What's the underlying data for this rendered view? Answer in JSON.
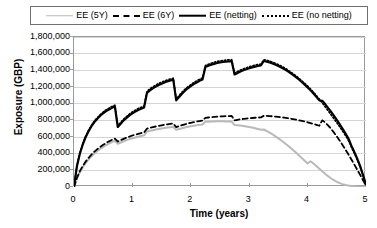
{
  "legend": {
    "items": [
      {
        "label": "EE (5Y)",
        "style": "solid-gray",
        "color": "#b9b9b9"
      },
      {
        "label": "EE (6Y)",
        "style": "dashed",
        "color": "#000000"
      },
      {
        "label": "EE (netting)",
        "style": "solid-black",
        "color": "#000000"
      },
      {
        "label": "EE (no netting)",
        "style": "dotted",
        "color": "#000000"
      }
    ]
  },
  "chart_data": {
    "type": "line",
    "title": "",
    "xlabel": "Time (years)",
    "ylabel": "Exposure (GBP)",
    "xlim": [
      0,
      5
    ],
    "ylim": [
      0,
      1800000
    ],
    "grid": true,
    "legend_position": "top",
    "xticks": [
      0,
      1,
      2,
      3,
      4,
      5
    ],
    "xtick_labels": [
      "0",
      "1",
      "2",
      "3",
      "4",
      "5"
    ],
    "yticks": [
      0,
      200000,
      400000,
      600000,
      800000,
      1000000,
      1200000,
      1400000,
      1600000,
      1800000
    ],
    "ytick_labels": [
      "0",
      "200,000",
      "400,000",
      "600,000",
      "800,000",
      "1,000,000",
      "1,200,000",
      "1,400,000",
      "1,600,000",
      "1,800,000"
    ],
    "x": [
      0,
      0.05,
      0.1,
      0.15,
      0.2,
      0.25,
      0.3,
      0.35,
      0.4,
      0.45,
      0.5,
      0.55,
      0.6,
      0.65,
      0.7,
      0.75,
      0.8,
      0.85,
      0.9,
      0.95,
      1.0,
      1.05,
      1.1,
      1.15,
      1.2,
      1.25,
      1.3,
      1.35,
      1.4,
      1.45,
      1.5,
      1.55,
      1.6,
      1.65,
      1.7,
      1.75,
      1.8,
      1.85,
      1.9,
      1.95,
      2.0,
      2.05,
      2.1,
      2.15,
      2.2,
      2.25,
      2.3,
      2.35,
      2.4,
      2.45,
      2.5,
      2.55,
      2.6,
      2.65,
      2.7,
      2.75,
      2.8,
      2.85,
      2.9,
      2.95,
      3.0,
      3.05,
      3.1,
      3.15,
      3.2,
      3.25,
      3.3,
      3.35,
      3.4,
      3.45,
      3.5,
      3.55,
      3.6,
      3.65,
      3.7,
      3.75,
      3.8,
      3.85,
      3.9,
      3.95,
      4.0,
      4.05,
      4.1,
      4.15,
      4.2,
      4.25,
      4.3,
      4.35,
      4.4,
      4.45,
      4.5,
      4.55,
      4.6,
      4.65,
      4.7,
      4.75,
      4.8,
      4.85,
      4.9,
      4.95,
      5.0
    ],
    "series": [
      {
        "name": "EE (netting)",
        "style": "solid",
        "color": "#000000",
        "width": 2.2,
        "values": [
          0,
          250000,
          400000,
          510000,
          600000,
          670000,
          730000,
          780000,
          820000,
          855000,
          885000,
          910000,
          930000,
          950000,
          965000,
          720000,
          760000,
          800000,
          830000,
          860000,
          885000,
          905000,
          925000,
          940000,
          955000,
          1130000,
          1160000,
          1185000,
          1205000,
          1225000,
          1240000,
          1255000,
          1268000,
          1278000,
          1288000,
          1040000,
          1080000,
          1120000,
          1155000,
          1185000,
          1210000,
          1235000,
          1255000,
          1275000,
          1290000,
          1440000,
          1455000,
          1468000,
          1478000,
          1488000,
          1495000,
          1500000,
          1505000,
          1508000,
          1510000,
          1350000,
          1368000,
          1385000,
          1400000,
          1412000,
          1425000,
          1435000,
          1445000,
          1452000,
          1458000,
          1512000,
          1505000,
          1495000,
          1482000,
          1468000,
          1452000,
          1435000,
          1415000,
          1393000,
          1370000,
          1345000,
          1318000,
          1290000,
          1260000,
          1228000,
          1195000,
          1160000,
          1122000,
          1082000,
          1040000,
          1035000,
          995000,
          950000,
          903000,
          855000,
          805000,
          752000,
          697000,
          640000,
          580000,
          495000,
          420000,
          340000,
          250000,
          140000,
          30000
        ]
      },
      {
        "name": "EE (no netting)",
        "style": "dotted",
        "color": "#000000",
        "width": 1.6,
        "values": [
          0,
          255000,
          408000,
          520000,
          610000,
          682000,
          742000,
          793000,
          834000,
          870000,
          900000,
          926000,
          947000,
          967000,
          982000,
          735000,
          775000,
          815000,
          846000,
          876000,
          902000,
          922000,
          942000,
          958000,
          972000,
          1148000,
          1178000,
          1203000,
          1223000,
          1243000,
          1258000,
          1273000,
          1286000,
          1296000,
          1306000,
          1058000,
          1098000,
          1138000,
          1173000,
          1203000,
          1228000,
          1253000,
          1273000,
          1293000,
          1308000,
          1458000,
          1473000,
          1486000,
          1496000,
          1506000,
          1513000,
          1518000,
          1523000,
          1526000,
          1528000,
          1368000,
          1386000,
          1403000,
          1418000,
          1430000,
          1443000,
          1453000,
          1463000,
          1470000,
          1476000,
          1528000,
          1521000,
          1511000,
          1498000,
          1484000,
          1468000,
          1451000,
          1431000,
          1409000,
          1386000,
          1361000,
          1334000,
          1306000,
          1276000,
          1244000,
          1211000,
          1176000,
          1138000,
          1098000,
          1056000,
          1010000,
          963000,
          916000,
          868000,
          820000,
          772000,
          722000,
          670000,
          616000,
          558000,
          478000,
          405000,
          328000,
          242000,
          136000,
          28000
        ]
      },
      {
        "name": "EE (6Y)",
        "style": "dashed",
        "color": "#000000",
        "width": 1.8,
        "values": [
          0,
          110000,
          190000,
          252000,
          305000,
          350000,
          390000,
          425000,
          455000,
          482000,
          507000,
          528000,
          548000,
          565000,
          580000,
          545000,
          562000,
          578000,
          592000,
          605000,
          618000,
          628000,
          638000,
          647000,
          655000,
          700000,
          710000,
          718000,
          726000,
          733000,
          740000,
          746000,
          752000,
          757000,
          762000,
          718000,
          730000,
          742000,
          752000,
          762000,
          770000,
          778000,
          785000,
          791000,
          796000,
          830000,
          834000,
          838000,
          841000,
          844000,
          846000,
          848000,
          850000,
          851000,
          852000,
          800000,
          806000,
          812000,
          817000,
          821000,
          825000,
          828000,
          831000,
          833000,
          835000,
          855000,
          853000,
          851000,
          848000,
          845000,
          841000,
          837000,
          832000,
          827000,
          821000,
          815000,
          808000,
          801000,
          793000,
          785000,
          776000,
          767000,
          757000,
          746000,
          735000,
          800000,
          775000,
          740000,
          700000,
          655000,
          607000,
          556000,
          502000,
          447000,
          390000,
          330000,
          270000,
          208000,
          145000,
          80000,
          18000
        ]
      },
      {
        "name": "EE (5Y)",
        "style": "solid",
        "color": "#b9b9b9",
        "width": 2.0,
        "values": [
          0,
          100000,
          175000,
          235000,
          286000,
          330000,
          368000,
          402000,
          432000,
          458000,
          482000,
          503000,
          522000,
          539000,
          554000,
          518000,
          534000,
          549000,
          562000,
          574000,
          585000,
          595000,
          604000,
          612000,
          620000,
          665000,
          674000,
          682000,
          689000,
          696000,
          702000,
          708000,
          713000,
          718000,
          722000,
          686000,
          696000,
          706000,
          714000,
          722000,
          729000,
          735000,
          741000,
          746000,
          750000,
          782000,
          784000,
          786000,
          787000,
          788000,
          788000,
          788000,
          787000,
          786000,
          784000,
          745000,
          742000,
          738000,
          733000,
          727000,
          721000,
          713000,
          705000,
          696000,
          686000,
          690000,
          672000,
          652000,
          631000,
          608000,
          584000,
          558000,
          531000,
          503000,
          474000,
          444000,
          413000,
          381000,
          349000,
          316000,
          283000,
          310000,
          283000,
          252000,
          220000,
          188000,
          158000,
          130000,
          105000,
          82000,
          62000,
          46000,
          34000,
          25000,
          18000,
          13000,
          9000,
          6000,
          4000,
          2000,
          0
        ]
      }
    ]
  }
}
